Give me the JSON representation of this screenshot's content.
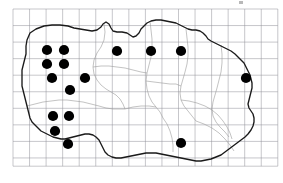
{
  "figure": {
    "type": "distribution-dot-map",
    "title": "",
    "caption": ""
  },
  "canvas": {
    "width": 283,
    "height": 183,
    "background": "#ffffff"
  },
  "grid": {
    "visible": true,
    "color": "#8f8f96",
    "stroke_width": 0.5,
    "origin_x": 13,
    "origin_y": 9,
    "cell_size": 16.55,
    "columns": 16,
    "rows": 9.5,
    "right_edge": 277.8,
    "bottom_edge": 166.2
  },
  "styles": {
    "coastline_color": "#1a1a1a",
    "coastline_width": 1.35,
    "internal_border_color": "#9a9a9a",
    "internal_border_width": 0.6,
    "dot_color": "#000000",
    "dot_radius": 5.1
  },
  "corner_mark": {
    "visible": true,
    "x": 239,
    "y": 1,
    "width": 4,
    "height": 3,
    "color": "#b9b9b9"
  },
  "chart_data": {
    "type": "scatter",
    "xlabel": "",
    "ylabel": "",
    "xlim": [
      13,
      277.8
    ],
    "ylim": [
      9,
      166.2
    ],
    "grid": true,
    "legend": null,
    "series": [
      {
        "name": "Recorded localities",
        "marker": "filled-circle",
        "color": "#000000",
        "count": 16,
        "points": [
          {
            "id": "dot-1",
            "x": 47,
            "y": 50,
            "grid_col": 2,
            "grid_row": 2
          },
          {
            "id": "dot-2",
            "x": 64,
            "y": 50,
            "grid_col": 3,
            "grid_row": 2
          },
          {
            "id": "dot-3",
            "x": 117,
            "y": 51,
            "grid_col": 6,
            "grid_row": 2
          },
          {
            "id": "dot-4",
            "x": 151,
            "y": 51,
            "grid_col": 8,
            "grid_row": 2
          },
          {
            "id": "dot-5",
            "x": 181,
            "y": 51,
            "grid_col": 10,
            "grid_row": 2
          },
          {
            "id": "dot-6",
            "x": 47,
            "y": 64,
            "grid_col": 2,
            "grid_row": 3
          },
          {
            "id": "dot-7",
            "x": 64,
            "y": 64,
            "grid_col": 3,
            "grid_row": 3
          },
          {
            "id": "dot-8",
            "x": 52,
            "y": 78,
            "grid_col": 2,
            "grid_row": 4
          },
          {
            "id": "dot-9",
            "x": 85,
            "y": 78,
            "grid_col": 4,
            "grid_row": 4
          },
          {
            "id": "dot-10",
            "x": 246,
            "y": 78,
            "grid_col": 14,
            "grid_row": 4
          },
          {
            "id": "dot-11",
            "x": 70,
            "y": 90,
            "grid_col": 3,
            "grid_row": 5
          },
          {
            "id": "dot-12",
            "x": 53,
            "y": 116,
            "grid_col": 2,
            "grid_row": 7
          },
          {
            "id": "dot-13",
            "x": 69,
            "y": 116,
            "grid_col": 3,
            "grid_row": 7
          },
          {
            "id": "dot-14",
            "x": 55,
            "y": 131,
            "grid_col": 2,
            "grid_row": 8
          },
          {
            "id": "dot-15",
            "x": 68,
            "y": 144,
            "grid_col": 3,
            "grid_row": 9
          },
          {
            "id": "dot-16",
            "x": 181,
            "y": 143,
            "grid_col": 10,
            "grid_row": 9
          }
        ]
      }
    ]
  },
  "geometry": {
    "coastline": "M 27,40 L 30,33 L 36,29 L 44,26 L 52,25 L 60,25 L 68,26 L 74,28 L 80,29 L 86,30 L 92,31 L 97,30 L 101,27 L 103,24 L 106,22 L 109,24 L 111,28 L 113,31 L 117,32 L 122,32 L 127,33 L 130,35 L 133,37 L 136,36 L 139,33 L 141,29 L 144,26 L 147,23 L 151,21 L 156,20 L 161,20 L 166,21 L 171,22 L 176,23 L 180,25 L 184,27 L 188,29 L 192,30 L 196,30 L 200,31 L 203,33 L 206,36 L 208,39 L 211,41 L 215,43 L 219,45 L 223,47 L 227,49 L 231,51 L 235,54 L 238,57 L 241,60 L 244,63 L 246,67 L 248,71 L 250,75 L 251,79 L 252,83 L 252,88 L 251,92 L 250,96 L 249,100 L 248,104 L 249,108 L 251,111 L 253,114 L 254,118 L 254,122 L 253,126 L 251,130 L 248,134 L 245,137 L 241,140 L 237,143 L 233,146 L 229,149 L 225,152 L 221,155 L 216,157 L 211,159 L 206,160 L 201,161 L 196,161 L 191,160 L 186,159 L 181,158 L 176,157 L 171,156 L 166,155 L 161,154 L 156,153 L 151,153 L 146,153 L 141,154 L 136,155 L 131,156 L 126,157 L 121,158 L 116,158 L 112,157 L 108,155 L 105,152 L 103,148 L 101,144 L 99,140 L 96,137 L 93,135 L 89,134 L 85,134 L 81,135 L 77,136 L 73,137 L 69,138 L 65,139 L 61,139 L 57,138 L 53,137 L 49,135 L 45,133 L 41,131 L 38,128 L 35,125 L 32,122 L 30,118 L 29,114 L 28,110 L 27,106 L 26,102 L 25,98 L 24,94 L 23,90 L 22,86 L 22,82 L 22,78 L 22,74 L 22,70 L 23,66 L 24,62 L 25,58 L 26,54 L 26,50 L 26,46 Z",
    "internal_borders": [
      "M 104,24 L 105,32 L 104,40 L 101,47 L 97,53 L 94,60 L 93,67 L 94,74 L 97,80 L 101,85 L 106,89 L 111,92 L 116,95 L 120,99 L 123,104 L 125,109",
      "M 150,21 L 151,30 L 152,39 L 152,48 L 151,57 L 149,65 L 147,73 L 146,81 L 147,89 L 149,96 L 152,102 L 156,107 L 160,112 L 163,118",
      "M 186,29 L 187,38 L 188,47 L 188,56 L 187,64 L 185,72 L 183,79 L 181,86 L 180,93 L 181,100 L 184,106 L 188,111 L 192,116 L 196,121",
      "M 93,67 L 101,66 L 109,66 L 117,67 L 125,68 L 133,70 L 141,72 L 147,73",
      "M 146,81 L 154,82 L 162,83 L 170,84 L 176,84 L 181,86",
      "M 125,109 L 133,107 L 141,106 L 149,106 L 156,107",
      "M 181,100 L 189,101 L 197,103 L 205,106 L 212,110 L 218,115 L 223,121 L 227,127 L 230,133 L 232,139",
      "M 221,45 L 222,54 L 222,63 L 221,72 L 219,80 L 217,88 L 215,95 L 213,102 L 212,109 L 213,116 L 216,122 L 220,127 L 225,132 L 229,137",
      "M 27,106 L 35,104 L 43,102 L 51,101 L 59,100 L 67,100 L 75,101 L 83,102 L 91,104 L 99,106 L 106,108 L 113,109 L 120,109 L 125,109",
      "M 196,121 L 204,124 L 212,128 L 219,133 L 225,139 L 230,145 L 234,151",
      "M 163,118 L 167,124 L 170,131 L 172,138 L 173,145 L 173,152"
    ]
  }
}
